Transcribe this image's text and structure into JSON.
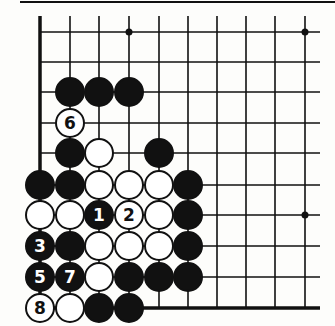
{
  "diagram": {
    "type": "go-board-fragment",
    "board_corner": "lower-left",
    "columns_x": [
      40,
      70,
      99,
      129,
      159,
      188,
      217,
      246,
      275,
      305
    ],
    "rows_y": [
      32,
      62,
      92,
      123,
      153,
      185,
      215,
      246,
      277,
      308
    ],
    "grid_right_x": 320,
    "grid_top_y": 16,
    "top_border_y": 2,
    "stone_radius": 14,
    "colors": {
      "line": "#111111",
      "black_stone": "#111111",
      "white_stone": "#ffffff",
      "background": "#fdfdfb"
    },
    "hoshi": [
      {
        "col": 3,
        "row": 0
      },
      {
        "col": 9,
        "row": 0
      },
      {
        "col": 9,
        "row": 6
      }
    ],
    "stones": [
      {
        "color": "black",
        "col": 1,
        "row": 2,
        "label": ""
      },
      {
        "color": "black",
        "col": 2,
        "row": 2,
        "label": ""
      },
      {
        "color": "black",
        "col": 3,
        "row": 2,
        "label": ""
      },
      {
        "color": "white",
        "col": 1,
        "row": 3,
        "label": "6"
      },
      {
        "color": "black",
        "col": 1,
        "row": 4,
        "label": ""
      },
      {
        "color": "white",
        "col": 2,
        "row": 4,
        "label": ""
      },
      {
        "color": "black",
        "col": 4,
        "row": 4,
        "label": ""
      },
      {
        "color": "black",
        "col": 0,
        "row": 5,
        "label": ""
      },
      {
        "color": "black",
        "col": 1,
        "row": 5,
        "label": ""
      },
      {
        "color": "white",
        "col": 2,
        "row": 5,
        "label": ""
      },
      {
        "color": "white",
        "col": 3,
        "row": 5,
        "label": ""
      },
      {
        "color": "white",
        "col": 4,
        "row": 5,
        "label": ""
      },
      {
        "color": "black",
        "col": 5,
        "row": 5,
        "label": ""
      },
      {
        "color": "white",
        "col": 0,
        "row": 6,
        "label": ""
      },
      {
        "color": "white",
        "col": 1,
        "row": 6,
        "label": ""
      },
      {
        "color": "black",
        "col": 2,
        "row": 6,
        "label": "1"
      },
      {
        "color": "white",
        "col": 3,
        "row": 6,
        "label": "2"
      },
      {
        "color": "white",
        "col": 4,
        "row": 6,
        "label": ""
      },
      {
        "color": "black",
        "col": 5,
        "row": 6,
        "label": ""
      },
      {
        "color": "black",
        "col": 0,
        "row": 7,
        "label": "3"
      },
      {
        "color": "black",
        "col": 1,
        "row": 7,
        "label": ""
      },
      {
        "color": "white",
        "col": 2,
        "row": 7,
        "label": ""
      },
      {
        "color": "white",
        "col": 3,
        "row": 7,
        "label": ""
      },
      {
        "color": "white",
        "col": 4,
        "row": 7,
        "label": ""
      },
      {
        "color": "black",
        "col": 5,
        "row": 7,
        "label": ""
      },
      {
        "color": "black",
        "col": 0,
        "row": 8,
        "label": "5"
      },
      {
        "color": "black",
        "col": 1,
        "row": 8,
        "label": "7"
      },
      {
        "color": "white",
        "col": 2,
        "row": 8,
        "label": ""
      },
      {
        "color": "black",
        "col": 3,
        "row": 8,
        "label": ""
      },
      {
        "color": "black",
        "col": 4,
        "row": 8,
        "label": ""
      },
      {
        "color": "black",
        "col": 5,
        "row": 8,
        "label": ""
      },
      {
        "color": "white",
        "col": 0,
        "row": 9,
        "label": "8"
      },
      {
        "color": "white",
        "col": 1,
        "row": 9,
        "label": ""
      },
      {
        "color": "black",
        "col": 2,
        "row": 9,
        "label": ""
      },
      {
        "color": "black",
        "col": 3,
        "row": 9,
        "label": ""
      }
    ]
  }
}
